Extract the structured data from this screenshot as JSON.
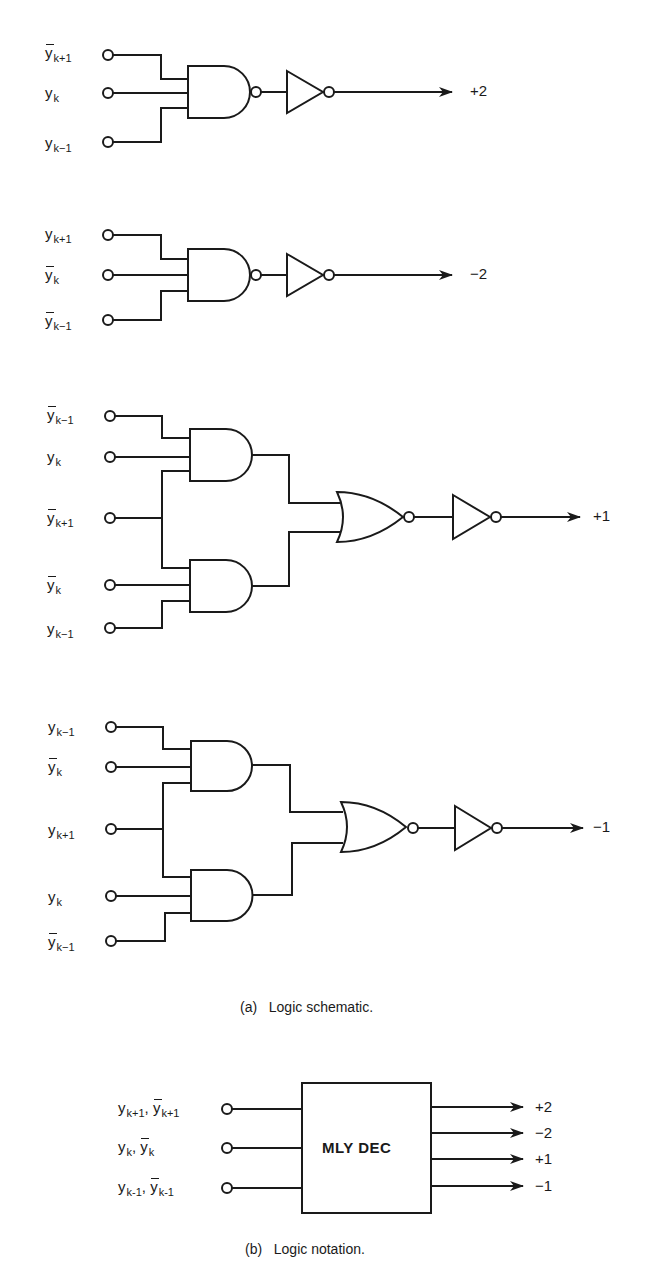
{
  "figure": {
    "schematic": {
      "caption": "(a)   Logic schematic.",
      "circuits": [
        {
          "id": "plus2",
          "output_label": "+2",
          "inputs": [
            {
              "var": "y",
              "sub": "k+1",
              "bar": true
            },
            {
              "var": "y",
              "sub": "k",
              "bar": false
            },
            {
              "var": "y",
              "sub": "k−1",
              "bar": false
            }
          ],
          "gates": [
            "NAND",
            "inverter"
          ]
        },
        {
          "id": "minus2",
          "output_label": "−2",
          "inputs": [
            {
              "var": "y",
              "sub": "k+1",
              "bar": false
            },
            {
              "var": "y",
              "sub": "k",
              "bar": true
            },
            {
              "var": "y",
              "sub": "k−1",
              "bar": true
            }
          ],
          "gates": [
            "NAND",
            "inverter"
          ]
        },
        {
          "id": "plus1",
          "output_label": "+1",
          "inputs": [
            {
              "var": "y",
              "sub": "k−1",
              "bar": true
            },
            {
              "var": "y",
              "sub": "k",
              "bar": false
            },
            {
              "var": "y",
              "sub": "k+1",
              "bar": true
            },
            {
              "var": "y",
              "sub": "k",
              "bar": true
            },
            {
              "var": "y",
              "sub": "k−1",
              "bar": false
            }
          ],
          "gates": [
            "AND",
            "AND",
            "NOR",
            "inverter"
          ]
        },
        {
          "id": "minus1",
          "output_label": "−1",
          "inputs": [
            {
              "var": "y",
              "sub": "k−1",
              "bar": false
            },
            {
              "var": "y",
              "sub": "k",
              "bar": true
            },
            {
              "var": "y",
              "sub": "k+1",
              "bar": false
            },
            {
              "var": "y",
              "sub": "k",
              "bar": false
            },
            {
              "var": "y",
              "sub": "k−1",
              "bar": true
            }
          ],
          "gates": [
            "AND",
            "AND",
            "NOR",
            "inverter"
          ]
        }
      ]
    },
    "notation": {
      "caption": "(b)   Logic notation.",
      "block_label": "MLY DEC",
      "inputs": [
        {
          "a": "y",
          "a_sub": "k+1",
          "b": "y",
          "b_sub": "k+1"
        },
        {
          "a": "y",
          "a_sub": "k",
          "b": "y",
          "b_sub": "k"
        },
        {
          "a": "y",
          "a_sub": "k-1",
          "b": "y",
          "b_sub": "k-1"
        }
      ],
      "outputs": [
        "+2",
        "−2",
        "+1",
        "−1"
      ]
    }
  }
}
